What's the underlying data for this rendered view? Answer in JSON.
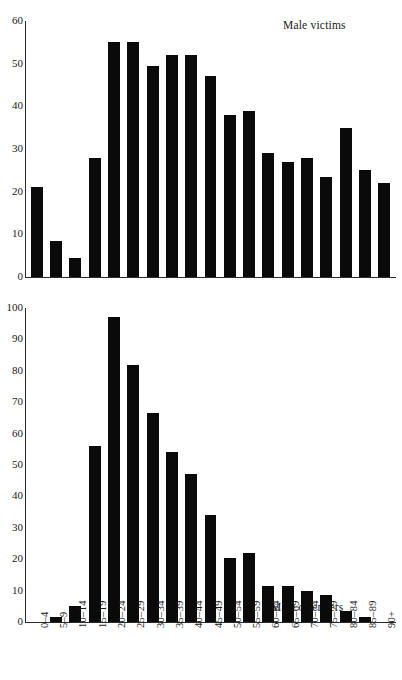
{
  "figure": {
    "background_color": "#ffffff",
    "bar_color": "#0a0a0a",
    "axis_color": "#2b2b2b"
  },
  "panels": {
    "victims": {
      "title": "Male victims",
      "y_ticks": [
        "60",
        "50",
        "40",
        "30",
        "20",
        "10",
        "0"
      ]
    },
    "offenders": {
      "title": "Male offenders",
      "y_ticks": [
        "100",
        "90",
        "80",
        "70",
        "60",
        "50",
        "40",
        "30",
        "20",
        "10",
        "0"
      ],
      "x_labels": [
        "0–4",
        "5–9",
        "10–14",
        "15–19",
        "20–24",
        "25–29",
        "30–34",
        "35–39",
        "40–44",
        "45–49",
        "50–54",
        "55–59",
        "60–64",
        "65–69",
        "70–74",
        "75–79",
        "80–84",
        "85–89",
        "90+"
      ]
    }
  },
  "chart_data": [
    {
      "type": "bar",
      "title": "Male victims",
      "xlabel": "",
      "ylabel": "",
      "ylim": [
        0,
        60
      ],
      "ytick_step": 10,
      "grid": false,
      "legend": false,
      "categories": [
        "0–4",
        "5–9",
        "10–14",
        "15–19",
        "20–24",
        "25–29",
        "30–34",
        "35–39",
        "40–44",
        "45–49",
        "50–54",
        "55–59",
        "60–64",
        "65–69",
        "70–74",
        "75–79",
        "80–84",
        "85–89",
        "90+"
      ],
      "values": [
        21,
        8.5,
        4.5,
        28,
        55,
        55,
        49.5,
        52,
        52,
        47,
        38,
        39,
        29,
        27,
        28,
        23.5,
        35,
        25,
        22
      ]
    },
    {
      "type": "bar",
      "title": "Male offenders",
      "xlabel": "",
      "ylabel": "",
      "ylim": [
        0,
        100
      ],
      "ytick_step": 10,
      "grid": false,
      "legend": false,
      "categories": [
        "0–4",
        "5–9",
        "10–14",
        "15–19",
        "20–24",
        "25–29",
        "30–34",
        "35–39",
        "40–44",
        "45–49",
        "50–54",
        "55–59",
        "60–64",
        "65–69",
        "70–74",
        "75–79",
        "80–84",
        "85–89",
        "90+"
      ],
      "values": [
        0,
        1.5,
        5,
        56,
        97,
        82,
        66.5,
        54,
        47,
        34,
        20.5,
        22,
        11.5,
        11.5,
        10,
        8.5,
        3.5,
        1.5,
        0
      ]
    }
  ]
}
